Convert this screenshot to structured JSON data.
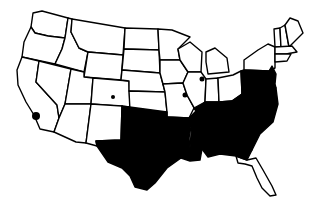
{
  "map": {
    "type": "us-states-choropleth",
    "colors": {
      "filled": "#000000",
      "unfilled": "#ffffff",
      "border": "#000000"
    },
    "filled_states": [
      "TX",
      "OK",
      "AR",
      "LA",
      "MS",
      "AL",
      "TN",
      "KY",
      "GA",
      "FL-panhandle",
      "SC",
      "NC",
      "VA",
      "WV",
      "MD",
      "DE",
      "PA",
      "NJ"
    ],
    "point_markers": [
      {
        "name": "southern-california",
        "x": 36,
        "y": 116,
        "r": 4
      },
      {
        "name": "colorado",
        "x": 113,
        "y": 97,
        "r": 2
      },
      {
        "name": "chicago-area",
        "x": 202,
        "y": 79,
        "r": 2.5
      },
      {
        "name": "st-louis-area",
        "x": 185,
        "y": 95,
        "r": 2.5
      }
    ]
  }
}
